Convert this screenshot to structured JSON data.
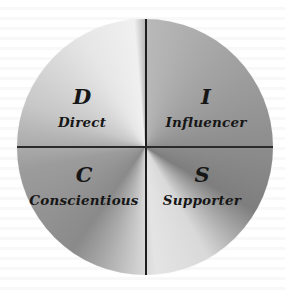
{
  "diagram": {
    "type": "quadrant-circle",
    "title": "",
    "quadrants": [
      {
        "position": "top-left",
        "letter": "D",
        "label": "Direct"
      },
      {
        "position": "top-right",
        "letter": "I",
        "label": "Influencer"
      },
      {
        "position": "bottom-left",
        "letter": "C",
        "label": "Conscientious"
      },
      {
        "position": "bottom-right",
        "letter": "S",
        "label": "Supporter"
      }
    ],
    "colors": {
      "fill": "gradient-gray",
      "light": "#f0f0f0",
      "dark": "#7e7e7e",
      "divider": "#1e1e1e",
      "text": "#161616",
      "background": "#ffffff"
    }
  }
}
